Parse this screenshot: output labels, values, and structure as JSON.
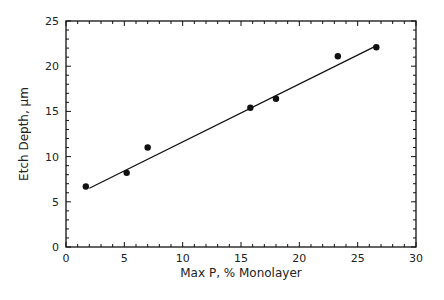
{
  "chart_data": {
    "type": "scatter",
    "title": "",
    "xlabel": "Max P, % Monolayer",
    "ylabel": "Etch Depth, μm",
    "xlim": [
      0,
      30
    ],
    "ylim": [
      0,
      25
    ],
    "xticks": [
      0,
      5,
      10,
      15,
      20,
      25,
      30
    ],
    "yticks": [
      0,
      5,
      10,
      15,
      20,
      25
    ],
    "grid": false,
    "legend": null,
    "series": [
      {
        "name": "data",
        "marker": "filled-circle",
        "x": [
          1.7,
          5.2,
          7.0,
          15.8,
          18.0,
          23.3,
          26.6
        ],
        "y": [
          6.7,
          8.2,
          11.0,
          15.4,
          16.4,
          21.1,
          22.1
        ]
      },
      {
        "name": "linear fit",
        "style": "line",
        "x": [
          2.0,
          26.5
        ],
        "y": [
          6.5,
          22.2
        ]
      }
    ]
  }
}
